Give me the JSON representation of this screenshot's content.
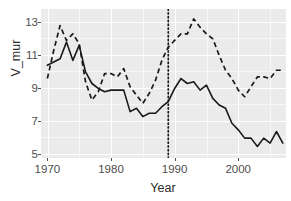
{
  "chart_data": {
    "type": "line",
    "title": "",
    "xlabel": "Year",
    "ylabel": "V_mur",
    "xlim": [
      1969,
      2007.5
    ],
    "ylim": [
      4.4,
      13.4
    ],
    "xticks": [
      1970,
      1980,
      1990,
      2000
    ],
    "yticks": [
      5,
      7,
      9,
      11,
      13
    ],
    "xticklabels": [
      "1970",
      "1980",
      "1990",
      "2000"
    ],
    "yticklabels": [
      "5",
      "7",
      "9",
      "11",
      "13"
    ],
    "grid": true,
    "legend": "none",
    "panel_background": "#ebebeb",
    "grid_color": "#ffffff",
    "line_color": "#1a1a1a",
    "annotations": [
      {
        "type": "vline",
        "x": 1989,
        "style": "dotted",
        "label": "1989 reference line"
      }
    ],
    "x": [
      1970,
      1971,
      1972,
      1973,
      1974,
      1975,
      1976,
      1977,
      1978,
      1979,
      1980,
      1981,
      1982,
      1983,
      1984,
      1985,
      1986,
      1987,
      1988,
      1989,
      1990,
      1991,
      1992,
      1993,
      1994,
      1995,
      1996,
      1997,
      1998,
      1999,
      2000,
      2001,
      2002,
      2003,
      2004,
      2005,
      2006,
      2007
    ],
    "series": [
      {
        "name": "solid",
        "style": "solid",
        "values": [
          10.0,
          10.2,
          10.4,
          11.4,
          10.3,
          11.2,
          9.6,
          8.9,
          8.6,
          8.4,
          8.5,
          8.5,
          8.5,
          7.2,
          7.4,
          6.9,
          7.1,
          7.1,
          7.5,
          7.8,
          8.6,
          9.2,
          8.9,
          9.0,
          8.5,
          8.8,
          8.0,
          7.6,
          7.4,
          6.5,
          6.1,
          5.6,
          5.6,
          5.1,
          5.6,
          5.3,
          6.0,
          5.3
        ]
      },
      {
        "name": "dashed",
        "style": "dashed",
        "values": [
          9.2,
          10.9,
          12.4,
          11.5,
          11.9,
          11.3,
          9.0,
          7.9,
          8.4,
          9.5,
          9.5,
          9.3,
          9.8,
          8.7,
          8.2,
          7.7,
          8.3,
          9.1,
          10.3,
          11.1,
          11.5,
          11.9,
          11.9,
          12.8,
          12.3,
          11.9,
          11.6,
          10.6,
          9.7,
          9.2,
          8.5,
          8.1,
          8.7,
          9.3,
          9.3,
          9.2,
          9.7,
          9.7
        ]
      }
    ]
  }
}
